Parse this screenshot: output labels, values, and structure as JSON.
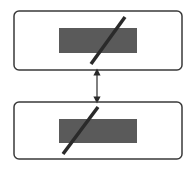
{
  "diagram": {
    "colors": {
      "box_stroke": "#3a3a3a",
      "fill_dark": "#5a5a5a",
      "slash": "#2a2a2a",
      "background": "#ffffff"
    },
    "boxes": [
      {
        "id": "top-box",
        "x": 14,
        "y": 11,
        "w": 168,
        "h": 59,
        "inner": {
          "x": 59,
          "y": 28,
          "w": 78,
          "h": 25
        },
        "slash": [
          91,
          64,
          125,
          17
        ]
      },
      {
        "id": "bottom-box",
        "x": 14,
        "y": 102,
        "w": 168,
        "h": 57,
        "inner": {
          "x": 59,
          "y": 119,
          "w": 78,
          "h": 24
        },
        "slash": [
          63,
          154,
          98,
          107
        ]
      }
    ],
    "connector": {
      "type": "double-arrow",
      "x": 97,
      "y1": 70,
      "y2": 102
    }
  }
}
